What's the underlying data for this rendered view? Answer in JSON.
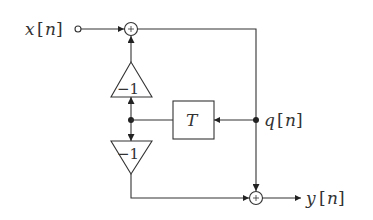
{
  "diagram": {
    "type": "signal-flow block diagram",
    "input": {
      "label": "x",
      "index": "n"
    },
    "output": {
      "label": "y",
      "index": "n"
    },
    "state": {
      "label": "q",
      "index": "n"
    },
    "delay_block": {
      "label": "T"
    },
    "gain_upper": {
      "label": "−1"
    },
    "gain_lower": {
      "label": "−1"
    },
    "adder_symbol": "+",
    "colors": {
      "stroke": "#333333",
      "background": "#ffffff"
    }
  }
}
